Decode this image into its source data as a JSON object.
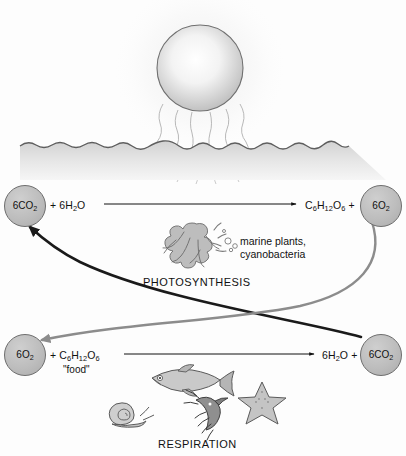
{
  "figure": {
    "background_color": "#fdfdfd"
  },
  "scene": {
    "sun": {
      "icon_name": "sun-sphere",
      "center_x": 200,
      "center_y": 68,
      "radius": 43,
      "fill_center": "#fcfcfc",
      "fill_edge": "#bcbcbc",
      "stroke": "#6f6f6f"
    },
    "light_rays": {
      "icon_name": "sunlight-rays",
      "count": 6,
      "color": "#a9a9a9"
    },
    "water": {
      "surface_y": 145,
      "bottom_y": 180,
      "fill_top": "#d6d6d6",
      "fill_bottom": "#f2f2f2",
      "surface_stroke": "#6f6f6f"
    }
  },
  "photosynthesis": {
    "label": "PHOTOSYNTHESIS",
    "organisms_caption_line1": "marine plants,",
    "organisms_caption_line2": "cyanobacteria",
    "seaweed_icon": "seaweed-algae-icon",
    "bubbles_icon": "oxygen-bubbles-icon",
    "reactant_circle": "6CO",
    "reactant_circle_sub": "2",
    "reactants_text_a": "+ 6H",
    "reactants_text_a_sub": "2",
    "reactants_text_b": "O",
    "products_text": "C",
    "products_glucose": "C6H12O6",
    "product_circle": "6O",
    "product_circle_sub": "2",
    "arrow_icon": "reaction-arrow-right"
  },
  "respiration": {
    "label": "RESPIRATION",
    "reactant_circle": "6O",
    "reactant_circle_sub": "2",
    "food_label": "\"food\"",
    "products_water": "6H2O",
    "product_circle": "6CO",
    "product_circle_sub": "2",
    "arrow_icon": "reaction-arrow-right",
    "animals": [
      {
        "name": "fish-icon"
      },
      {
        "name": "snail-icon"
      },
      {
        "name": "shrimp-icon"
      },
      {
        "name": "starfish-icon"
      }
    ]
  },
  "cycle_arrows": [
    {
      "name": "co2-to-photosynthesis-arrow",
      "color": "#1a1a1a",
      "description": "carbon dioxide from respiration to photosynthesis"
    },
    {
      "name": "o2-to-respiration-arrow",
      "color": "#8c8c8c",
      "description": "oxygen from photosynthesis to respiration"
    }
  ],
  "equations": {
    "photosynthesis_plain": "6CO2 + 6H2O -> C6H12O6 + 6O2",
    "respiration_plain": "6O2 + C6H12O6 -> 6H2O + 6CO2"
  }
}
